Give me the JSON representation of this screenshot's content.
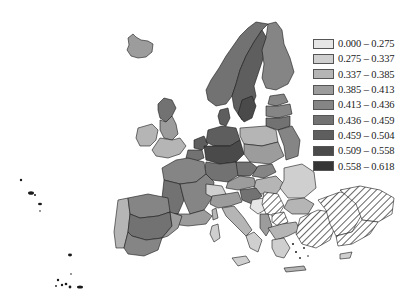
{
  "map": {
    "type": "choropleth",
    "subject": "Europe regional map",
    "hatched_region_note": "Turkey and parts of Balkans shown with diagonal hatching (no data)",
    "stroke_color": "#1a1a1a",
    "hatch_color": "#222222"
  },
  "legend": {
    "items": [
      {
        "label": "0.000 – 0.275",
        "color": "#e6e6e6"
      },
      {
        "label": "0.275 – 0.337",
        "color": "#cfcfcf"
      },
      {
        "label": "0.337 – 0.385",
        "color": "#b5b5b5"
      },
      {
        "label": "0.385 – 0.413",
        "color": "#9c9c9c"
      },
      {
        "label": "0.413 – 0.436",
        "color": "#858585"
      },
      {
        "label": "0.436 – 0.459",
        "color": "#727272"
      },
      {
        "label": "0.459 – 0.504",
        "color": "#5e5e5e"
      },
      {
        "label": "0.509 – 0.558",
        "color": "#4a4a4a"
      },
      {
        "label": "0.558 – 0.618",
        "color": "#353535"
      }
    ]
  }
}
